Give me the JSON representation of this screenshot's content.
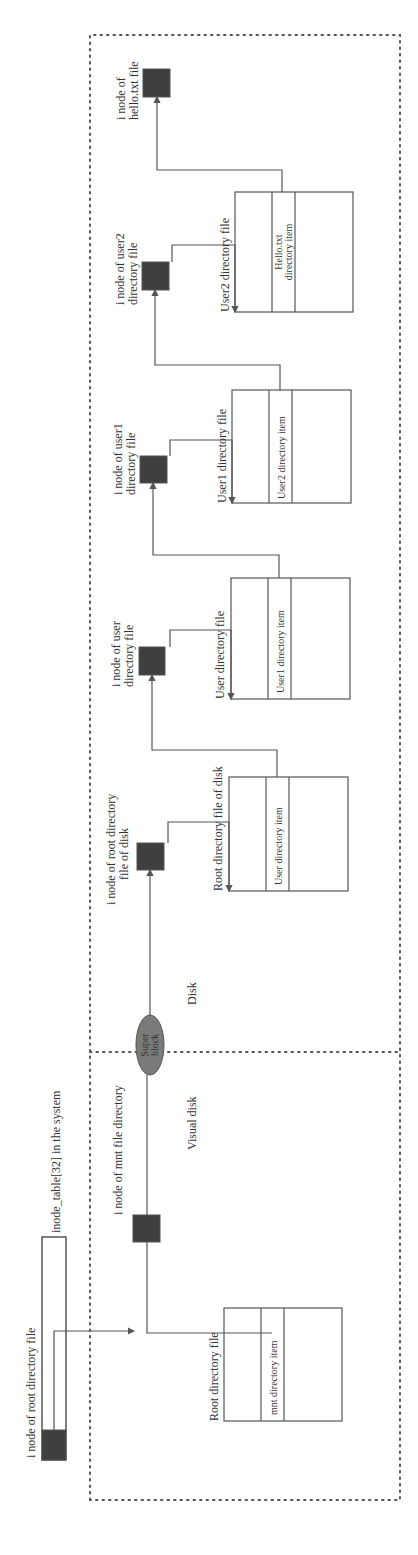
{
  "colors": {
    "line": "#555555",
    "inode_fill": "#3f3f3f",
    "superblock_fill": "#7a7a7a",
    "text": "#333333",
    "background": "#ffffff"
  },
  "orientation": "rotated -90deg (diagram reads bottom-to-top)",
  "labels": {
    "inode_root_dir": "i node of root directory file",
    "inode_table": "inode_table[32] in the system",
    "inode_mnt": "i node of mnt file directory",
    "visual_disk": "Visual disk",
    "disk": "Disk",
    "superblock_line1": "Super",
    "superblock_line2": "block",
    "root_dir_file": "Root directory file",
    "mnt_item": "mnt directory item",
    "inode_root_disk_line1": "i node of root directory",
    "inode_root_disk_line2": "file of disk",
    "root_dir_file_disk": "Root directory file of disk",
    "user_item": "User directory item",
    "inode_user_line1": "i node of user",
    "inode_user_line2": "directory file",
    "user_dir_file": "User directory file",
    "user1_item": "User1 directory item",
    "inode_user1_line1": "i node of user1",
    "inode_user1_line2": "directory file",
    "user1_dir_file": "User1 directory file",
    "user2_item": "User2 directory item",
    "inode_user2_line1": "i node of user2",
    "inode_user2_line2": "directory file",
    "user2_dir_file": "User2 directory file",
    "hello_item_line1": "Hello.txt",
    "hello_item_line2": "directory item",
    "inode_hello_line1": "i node of",
    "inode_hello_line2": "hello.txt file"
  },
  "regions": [
    "Visual disk",
    "Disk"
  ],
  "chain": [
    "i node of root directory file",
    "Root directory file",
    "mnt directory item",
    "i node of mnt file directory",
    "Super block",
    "i node of root directory file of disk",
    "Root directory file of disk",
    "User directory item",
    "i node of user directory file",
    "User directory file",
    "User1 directory item",
    "i node of user1 directory file",
    "User1 directory file",
    "User2 directory item",
    "i node of user2 directory file",
    "User2 directory file",
    "Hello.txt directory item",
    "i node of hello.txt file"
  ]
}
